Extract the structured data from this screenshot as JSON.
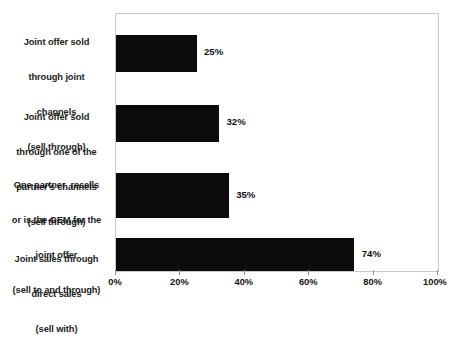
{
  "chart_data": {
    "type": "bar",
    "orientation": "horizontal",
    "title": "",
    "xlabel": "",
    "ylabel": "",
    "xlim": [
      0,
      100
    ],
    "xticks": [
      0,
      20,
      40,
      60,
      80,
      100
    ],
    "xtick_labels": [
      "0%",
      "20%",
      "40%",
      "60%",
      "80%",
      "100%"
    ],
    "grid": false,
    "legend": false,
    "bar_color": "#0b0b0b",
    "plot_border_color": "#c9c9c9",
    "categories": [
      "Joint offer sold\nthrough joint\nchannels\n(sell through)",
      "Joint offer sold\nthrough one of the\npartner's channels\n(sell through)",
      "One partner  resells\nor is the OEM for the\njoint offer\n(sell to and through)",
      "Joint sales through\ndirect sales\n(sell with)"
    ],
    "values": [
      25,
      32,
      35,
      74
    ],
    "value_labels": [
      "25%",
      "32%",
      "35%",
      "74%"
    ]
  },
  "categories": {
    "0": {
      "line1": "Joint offer sold",
      "line2": "through joint",
      "line3": "channels",
      "line4": "(sell through)"
    },
    "1": {
      "line1": "Joint offer sold",
      "line2": "through one of the",
      "line3": "partner's channels",
      "line4": "(sell through)"
    },
    "2": {
      "line1": "One partner  resells",
      "line2": "or is the OEM for the",
      "line3": "joint offer",
      "line4": "(sell to and through)"
    },
    "3": {
      "line1": "Joint sales through",
      "line2": "direct sales",
      "line3": "(sell with)",
      "line4": ""
    }
  },
  "bar_values": {
    "0": "25%",
    "1": "32%",
    "2": "35%",
    "3": "74%"
  },
  "axis": {
    "tick0": "0%",
    "tick1": "20%",
    "tick2": "40%",
    "tick3": "60%",
    "tick4": "80%",
    "tick5": "100%"
  }
}
